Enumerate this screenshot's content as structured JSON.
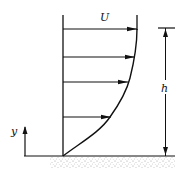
{
  "diagram": {
    "labels": {
      "free_stream_velocity": "U",
      "thickness": "h",
      "axis": "y"
    },
    "colors": {
      "ink": "#111111",
      "ground_speckle": "#9a9a9a",
      "background": "#ffffff"
    },
    "velocity_arrows": [
      {
        "y": 29,
        "x_end": 137
      },
      {
        "y": 57,
        "x_end": 135
      },
      {
        "y": 82,
        "x_end": 127
      },
      {
        "y": 117,
        "x_end": 110
      }
    ]
  }
}
